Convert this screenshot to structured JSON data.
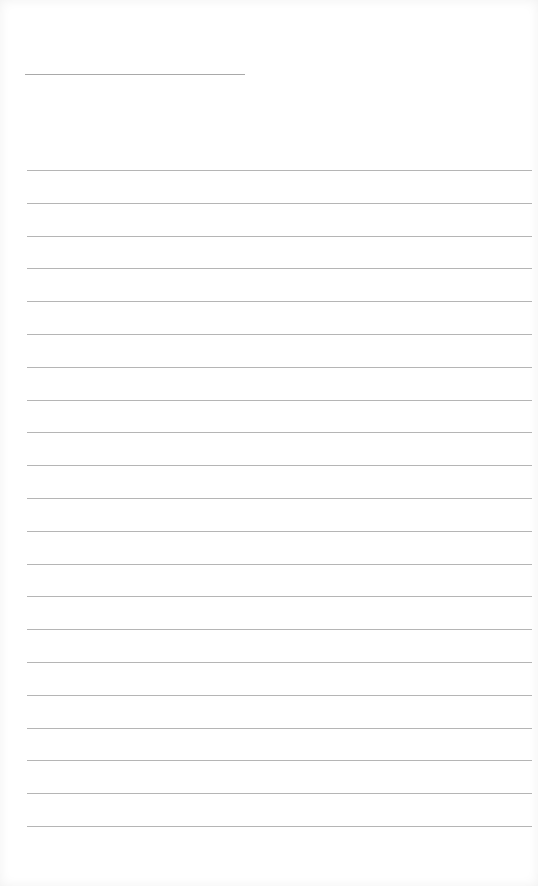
{
  "document": {
    "type": "lined-paper",
    "name_line": {
      "left": 25,
      "top": 74,
      "width": 220
    },
    "rules": {
      "count": 21,
      "first_top": 170,
      "spacing": 32.8,
      "left": 27,
      "width": 505
    },
    "line_color": "#b5b5b5",
    "background": "#ffffff"
  }
}
